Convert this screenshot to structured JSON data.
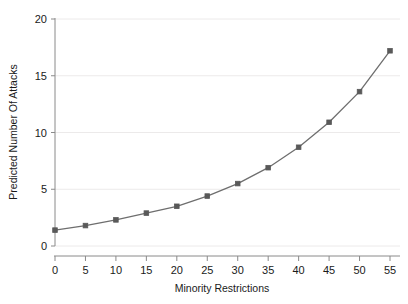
{
  "chart_data": {
    "type": "line",
    "title": "",
    "subtitle": "",
    "xlabel": "Minority Restrictions",
    "ylabel": "Predicted Number Of Attacks",
    "x": [
      0,
      5,
      10,
      15,
      20,
      25,
      30,
      35,
      40,
      45,
      50,
      55
    ],
    "values": [
      1.4,
      1.8,
      2.3,
      2.9,
      3.5,
      4.4,
      5.5,
      6.9,
      8.7,
      10.9,
      13.6,
      17.2
    ],
    "series": [
      {
        "name": "Predicted Number Of Attacks",
        "values": [
          1.4,
          1.8,
          2.3,
          2.9,
          3.5,
          4.4,
          5.5,
          6.9,
          8.7,
          10.9,
          13.6,
          17.2
        ]
      }
    ],
    "xlim": [
      -2.5,
      57.5
    ],
    "ylim": [
      0,
      21
    ],
    "xticks": [
      0,
      5,
      10,
      15,
      20,
      25,
      30,
      35,
      40,
      45,
      50,
      55
    ],
    "xtick_labels": [
      "0",
      "5",
      "10",
      "15",
      "20",
      "25",
      "30",
      "35",
      "40",
      "45",
      "50",
      "55"
    ],
    "yticks": [
      0,
      5,
      10,
      15,
      20
    ],
    "ytick_labels": [
      "0",
      "5",
      "10",
      "15",
      "20"
    ],
    "grid": "horizontal",
    "legend": "none",
    "marker": "square",
    "line_color": "#6e6e6e",
    "marker_color": "#595959",
    "grid_color": "#eceaea",
    "axis_color": "#8a8a8a",
    "background": "#ffffff"
  }
}
